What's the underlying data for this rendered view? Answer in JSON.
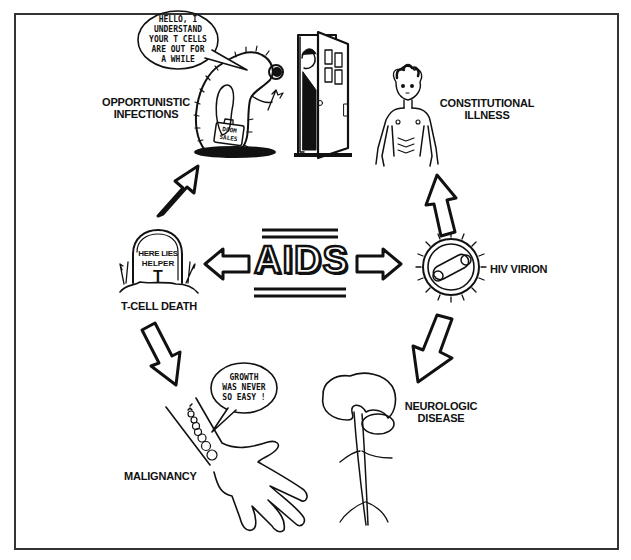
{
  "diagram": {
    "title": "AIDS",
    "center": {
      "label": "AIDS"
    },
    "nodes": [
      {
        "id": "opportunistic-infections",
        "label_lines": [
          "OPPORTUNISTIC",
          "INFECTIONS"
        ]
      },
      {
        "id": "constitutional-illness",
        "label_lines": [
          "CONSTITUTIONAL",
          "ILLNESS"
        ]
      },
      {
        "id": "hiv-virion",
        "label_lines": [
          "HIV VIRION"
        ]
      },
      {
        "id": "neurologic-disease",
        "label_lines": [
          "NEUROLOGIC",
          "DISEASE"
        ]
      },
      {
        "id": "malignancy",
        "label_lines": [
          "MALIGNANCY"
        ]
      },
      {
        "id": "t-cell-death",
        "label_lines": [
          "T-CELL DEATH"
        ]
      }
    ],
    "speech_bubbles": {
      "infection": [
        "HELLO, I",
        "UNDERSTAND",
        "YOUR T CELLS",
        "ARE OUT FOR",
        "A WHILE"
      ],
      "malignancy": [
        "GROWTH",
        "WAS NEVER",
        "SO EASY !"
      ]
    },
    "tombstone": {
      "line1": "HERE LIES",
      "line2": "HELPER",
      "line3": "T"
    },
    "briefcase": [
      "DOOM",
      "SALES"
    ],
    "arrows": [
      {
        "from": "hiv-virion",
        "to": "constitutional-illness",
        "direction": "up"
      },
      {
        "from": "hiv-virion",
        "to": "neurologic-disease",
        "direction": "down-left"
      },
      {
        "from": "t-cell-death",
        "to": "opportunistic-infections",
        "direction": "up-right"
      },
      {
        "from": "t-cell-death",
        "to": "malignancy",
        "direction": "down"
      },
      {
        "from": "aids",
        "to": "t-cell-death",
        "direction": "left"
      },
      {
        "from": "aids",
        "to": "hiv-virion",
        "direction": "right"
      }
    ],
    "colors": {
      "ink": "#111111",
      "paper": "#ffffff",
      "frame": "#333333"
    }
  }
}
